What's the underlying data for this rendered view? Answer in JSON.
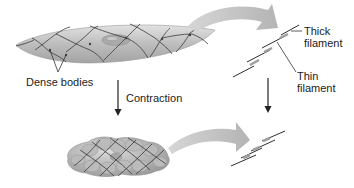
{
  "diagram": {
    "labels": {
      "dense_bodies": "Dense bodies",
      "contraction": "Contraction",
      "thick_filament_1": "Thick",
      "thick_filament_2": "filament",
      "thin_filament_1": "Thin",
      "thin_filament_2": "filament"
    },
    "colors": {
      "cell_fill": "#b8b8b8",
      "cell_light": "#d8d8d8",
      "nucleus": "#9e9e9e",
      "arrow_curved": "#c4c4c4",
      "line": "#333333",
      "filament_overlap": "#aaaaaa"
    }
  }
}
